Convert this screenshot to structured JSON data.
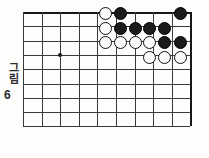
{
  "figure": {
    "caption_word": "그림",
    "caption_number": "6",
    "type": "go-board-diagram"
  },
  "board": {
    "grid_cols": 10,
    "grid_rows": 9,
    "origin_x": 23,
    "origin_y": 12,
    "cell": 18.6,
    "cell_y": 14.3,
    "star_points": [
      {
        "col": 2,
        "row": 3
      }
    ],
    "line_color": "#3a3a3a",
    "edge_color": "#171717",
    "board_color": "#fdfdfc"
  },
  "stones": {
    "black_color": "#1b1b1b",
    "white_color": "#fbfbfb",
    "list": [
      {
        "color": "white",
        "x": 105,
        "y": 13
      },
      {
        "color": "black",
        "x": 120,
        "y": 13
      },
      {
        "color": "black",
        "x": 180,
        "y": 13
      },
      {
        "color": "white",
        "x": 105,
        "y": 28
      },
      {
        "color": "black",
        "x": 120,
        "y": 28
      },
      {
        "color": "black",
        "x": 135,
        "y": 28
      },
      {
        "color": "black",
        "x": 149,
        "y": 28
      },
      {
        "color": "black",
        "x": 164,
        "y": 28
      },
      {
        "color": "white",
        "x": 105,
        "y": 42
      },
      {
        "color": "white",
        "x": 120,
        "y": 42
      },
      {
        "color": "white",
        "x": 135,
        "y": 42
      },
      {
        "color": "white",
        "x": 149,
        "y": 42
      },
      {
        "color": "black",
        "x": 164,
        "y": 42
      },
      {
        "color": "black",
        "x": 180,
        "y": 42
      },
      {
        "color": "white",
        "x": 149,
        "y": 57
      },
      {
        "color": "white",
        "x": 164,
        "y": 57
      },
      {
        "color": "white",
        "x": 180,
        "y": 57
      }
    ]
  }
}
